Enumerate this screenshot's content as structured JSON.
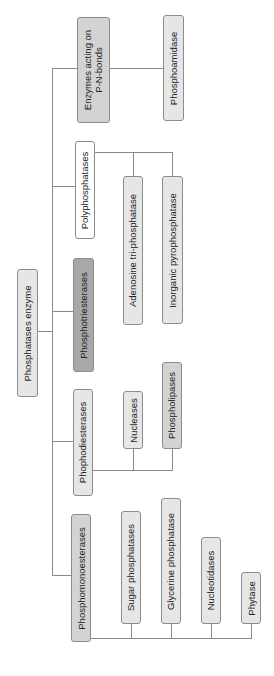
{
  "diagram": {
    "type": "tree",
    "orientation": "rotated-90-ccw",
    "root": {
      "label": "Phosphatases enzyme"
    },
    "categories": [
      {
        "label": "Enzymes acting on P-N-bonds",
        "line1": "Enzymes acting on",
        "line2": "P-N-bonds",
        "children": [
          "Phosphoamidase"
        ]
      },
      {
        "label": "Polyphosphatases",
        "children": [
          "Adenosine tri-phosphatase",
          "Inorganic pyrophosphatase"
        ]
      },
      {
        "label": "Phosphotriesterases",
        "children": []
      },
      {
        "label": "Phophodiesterases",
        "children": [
          "Nucleases",
          "Phospholipases"
        ]
      },
      {
        "label": "Phosphomonoesterases",
        "children": [
          "Sugar phosphatases",
          "Glycerine phosphatase",
          "Nucleotidases",
          "Phytase"
        ]
      }
    ]
  },
  "colors": {
    "line": "#8a8a8a",
    "border": "#8c8c8c",
    "fill_light": "#e6e6e6",
    "fill_mid": "#d3d3d3",
    "fill_dark": "#a8a8a8",
    "fill_white": "#ffffff"
  }
}
